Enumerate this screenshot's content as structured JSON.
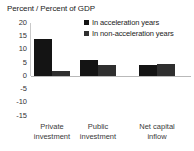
{
  "chart_data": {
    "type": "bar",
    "title": "Percent / Percent of GDP",
    "xlabel": "",
    "ylabel": "",
    "ylim": [
      -15,
      20
    ],
    "yticks": [
      "20",
      "15",
      "10",
      "5",
      "0",
      "-5",
      "-10",
      "-15"
    ],
    "grid": false,
    "legend_position": "top-right",
    "categories": [
      "Private investment",
      "Public investment",
      "Net capital inflow"
    ],
    "category_lines": [
      [
        "Private",
        "investment"
      ],
      [
        "Public",
        "investment"
      ],
      [
        "Net capital",
        "inflow"
      ]
    ],
    "series": [
      {
        "name": "In acceleration years",
        "color": "#141414",
        "values": [
          14,
          6,
          4
        ]
      },
      {
        "name": "In non-acceleration years",
        "color": "#2f2f2f",
        "values": [
          2,
          4,
          4.5
        ]
      }
    ]
  },
  "legend": {
    "items": [
      {
        "label": "In acceleration years",
        "swatch": "legend-swatch-series-1"
      },
      {
        "label": "In non-acceleration years",
        "swatch": "legend-swatch-series-2"
      }
    ]
  },
  "axis": {
    "y_tick_labels": [
      "20",
      "15",
      "10",
      "5",
      "0",
      "-5",
      "-10",
      "-15"
    ]
  }
}
